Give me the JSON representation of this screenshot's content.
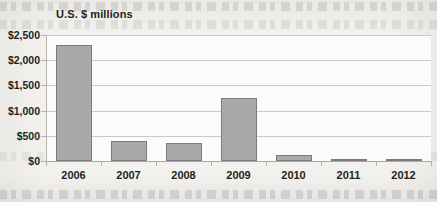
{
  "chart_data": {
    "type": "bar",
    "title": "U.S. $ millions",
    "subtitle": "",
    "xlabel": "",
    "ylabel": "",
    "categories": [
      "2006",
      "2007",
      "2008",
      "2009",
      "2010",
      "2011",
      "2012"
    ],
    "values": [
      2300,
      400,
      360,
      1250,
      110,
      35,
      30
    ],
    "ylim": [
      0,
      2500
    ],
    "yticks": [
      0,
      500,
      1000,
      1500,
      2000,
      2500
    ],
    "ytick_labels": [
      "$0",
      "$500",
      "$1,000",
      "$1,500",
      "$2,000",
      "$2,500"
    ],
    "grid": true,
    "legend": false,
    "bar_color": "#a9a9a9",
    "bar_border_color": "#7b7b7b",
    "gridline_color": "#c9c9c6",
    "axis_color": "#a9a9a6",
    "background_color": "#fbfbfa",
    "page_color": "#f2f1ee",
    "text_color": "#231f1e"
  }
}
